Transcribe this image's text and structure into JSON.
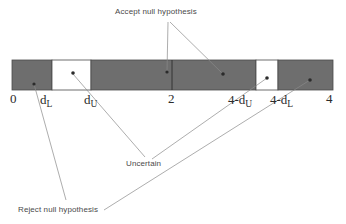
{
  "figure": {
    "colors": {
      "reject_fill": "#6e6e6e",
      "uncertain_fill": "#ffffff",
      "bar_stroke": "#4a4a4a",
      "leader_line": "#7a7a7a",
      "dot": "#2b2b2b",
      "text": "#3a3a3a"
    },
    "bar": {
      "x": 12,
      "y": 60,
      "width": 321,
      "height": 30
    },
    "segments": [
      {
        "name": "reject-positive-autocorrelation",
        "label": "Reject null hypothesis",
        "fill": "reject_fill",
        "from": 0,
        "to": 52
      },
      {
        "name": "uncertain-lower",
        "label": "Uncertain",
        "fill": "uncertain_fill",
        "from": 52,
        "to": 91
      },
      {
        "name": "accept-null",
        "label": "Accept null hypothesis",
        "fill": "reject_fill",
        "from": 91,
        "to": 256
      },
      {
        "name": "uncertain-upper",
        "label": "Uncertain",
        "fill": "uncertain_fill",
        "from": 256,
        "to": 278
      },
      {
        "name": "reject-negative-autocorrelation",
        "label": "Reject null hypothesis",
        "fill": "reject_fill",
        "from": 278,
        "to": 333
      }
    ],
    "axis": {
      "ticks": [
        {
          "name": "tick-0",
          "text": "0",
          "sub": "",
          "x": 10,
          "y": 96
        },
        {
          "name": "tick-dl",
          "text": "d",
          "sub": "L",
          "x": 40,
          "y": 97
        },
        {
          "name": "tick-du",
          "text": "d",
          "sub": "U",
          "x": 84,
          "y": 97
        },
        {
          "name": "tick-2",
          "text": "2",
          "sub": "",
          "x": 168,
          "y": 96
        },
        {
          "name": "tick-4-du",
          "text": "4-d",
          "sub": "U",
          "x": 228,
          "y": 97
        },
        {
          "name": "tick-4-dl",
          "text": "4-d",
          "sub": "L",
          "x": 270,
          "y": 97
        },
        {
          "name": "tick-4",
          "text": "4",
          "sub": "",
          "x": 326,
          "y": 96
        }
      ],
      "mid_tick_x": 172
    },
    "callouts": [
      {
        "name": "callout-accept-null-hypothesis",
        "text": "Accept null hypothesis",
        "x": 115,
        "y": 8
      },
      {
        "name": "callout-uncertain",
        "text": "Uncertain",
        "x": 126,
        "y": 160
      },
      {
        "name": "callout-reject-null-hypothesis",
        "text": "Reject null hypothesis",
        "x": 18,
        "y": 206
      }
    ],
    "dots": [
      {
        "name": "dot-reject-lower",
        "x": 34,
        "y": 84
      },
      {
        "name": "dot-uncertain-lower",
        "x": 73,
        "y": 73
      },
      {
        "name": "dot-accept-left",
        "x": 167,
        "y": 72
      },
      {
        "name": "dot-accept-right",
        "x": 223,
        "y": 74
      },
      {
        "name": "dot-uncertain-upper",
        "x": 267,
        "y": 78
      },
      {
        "name": "dot-reject-upper",
        "x": 310,
        "y": 80
      }
    ]
  }
}
